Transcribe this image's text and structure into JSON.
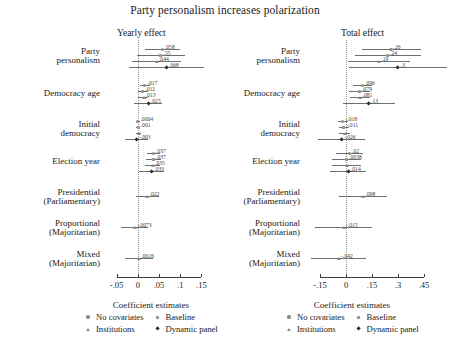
{
  "chart_data": {
    "type": "scatter",
    "title": "Party personalism increases polarization",
    "xlabel": "Coefficient estimates",
    "legend_title": "Coefficient estimates",
    "legend_position": "bottom",
    "grid": false,
    "series_names": [
      "No covariates",
      "Baseline",
      "Institutions",
      "Dynamic panel"
    ],
    "markers": [
      "circle",
      "square",
      "triangle",
      "diamond"
    ],
    "categories": [
      "Party personalism",
      "Democracy age",
      "Initial democracy",
      "Election year",
      "Presidential (Parliamentary)",
      "Proportional (Majoritarian)",
      "Mixed (Majoritarian)"
    ],
    "panels": [
      {
        "name": "Yearly effect",
        "xlim": [
          -0.075,
          0.175
        ],
        "xticks": [
          -0.05,
          0,
          0.05,
          0.1,
          0.15
        ],
        "xticklabels": [
          "-.05",
          "0",
          ".05",
          ".1",
          ".15"
        ],
        "rows": [
          {
            "category": "Party personalism",
            "points": [
              {
                "series": "No covariates",
                "value": 0.058,
                "label": ".058",
                "lo": 0.016,
                "hi": 0.1
              },
              {
                "series": "Baseline",
                "value": 0.055,
                "label": ".55",
                "lo": -0.002,
                "hi": 0.112
              },
              {
                "series": "Institutions",
                "value": 0.044,
                "label": ".044",
                "lo": -0.014,
                "hi": 0.103
              },
              {
                "series": "Dynamic panel",
                "value": 0.068,
                "label": ".068",
                "lo": -0.02,
                "hi": 0.157
              }
            ]
          },
          {
            "category": "Democracy age",
            "points": [
              {
                "series": "No covariates",
                "value": 0.017,
                "label": ".017",
                "lo": 0.006,
                "hi": 0.028
              },
              {
                "series": "Baseline",
                "value": 0.012,
                "label": ".012",
                "lo": 0.0,
                "hi": 0.024
              },
              {
                "series": "Institutions",
                "value": 0.013,
                "label": ".013",
                "lo": 0.001,
                "hi": 0.025
              },
              {
                "series": "Dynamic panel",
                "value": 0.025,
                "label": ".025",
                "lo": -0.008,
                "hi": 0.058
              }
            ]
          },
          {
            "category": "Initial democracy",
            "points": [
              {
                "series": "No covariates",
                "value": 0.0004,
                "label": ".0004",
                "lo": -0.004,
                "hi": 0.005
              },
              {
                "series": "Baseline",
                "value": 0.001,
                "label": ".001",
                "lo": -0.004,
                "hi": 0.006
              },
              {
                "series": "Institutions",
                "value": 0.0015,
                "label": "",
                "lo": -0.004,
                "hi": 0.007
              },
              {
                "series": "Dynamic panel",
                "value": -0.003,
                "label": "-.003",
                "lo": -0.03,
                "hi": 0.024
              }
            ]
          },
          {
            "category": "Election year",
            "points": [
              {
                "series": "No covariates",
                "value": 0.037,
                "label": ".037",
                "lo": 0.021,
                "hi": 0.053
              },
              {
                "series": "Baseline",
                "value": 0.037,
                "label": ".037",
                "lo": 0.02,
                "hi": 0.054
              },
              {
                "series": "Institutions",
                "value": 0.035,
                "label": ".035",
                "lo": 0.018,
                "hi": 0.052
              },
              {
                "series": "Dynamic panel",
                "value": 0.033,
                "label": ".033",
                "lo": 0.004,
                "hi": 0.062
              }
            ]
          },
          {
            "category": "Presidential (Parliamentary)",
            "points": [
              {
                "series": "Institutions",
                "value": 0.022,
                "label": ".022",
                "lo": -0.005,
                "hi": 0.049
              }
            ]
          },
          {
            "category": "Proportional (Majoritarian)",
            "points": [
              {
                "series": "Institutions",
                "value": -0.0073,
                "label": "-.0073",
                "lo": -0.04,
                "hi": 0.025
              }
            ]
          },
          {
            "category": "Mixed (Majoritarian)",
            "points": [
              {
                "series": "Institutions",
                "value": 0.0026,
                "label": ".0026",
                "lo": -0.03,
                "hi": 0.035
              }
            ]
          }
        ]
      },
      {
        "name": "Total effect",
        "xlim": [
          -0.225,
          0.525
        ],
        "xticks": [
          -0.15,
          0,
          0.15,
          0.3,
          0.45
        ],
        "xticklabels": [
          "-.15",
          "0",
          ".15",
          ".3",
          ".45"
        ],
        "rows": [
          {
            "category": "Party personalism",
            "points": [
              {
                "series": "No covariates",
                "value": 0.26,
                "label": ".26",
                "lo": 0.09,
                "hi": 0.43
              },
              {
                "series": "Baseline",
                "value": 0.24,
                "label": ".24",
                "lo": 0.05,
                "hi": 0.43
              },
              {
                "series": "Institutions",
                "value": 0.19,
                "label": ".19",
                "lo": 0.01,
                "hi": 0.37
              },
              {
                "series": "Dynamic panel",
                "value": 0.3,
                "label": ".3",
                "lo": 0.02,
                "hi": 0.58
              }
            ]
          },
          {
            "category": "Democracy age",
            "points": [
              {
                "series": "No covariates",
                "value": 0.096,
                "label": ".096",
                "lo": 0.04,
                "hi": 0.152
              },
              {
                "series": "Baseline",
                "value": 0.079,
                "label": ".079",
                "lo": 0.02,
                "hi": 0.138
              },
              {
                "series": "Institutions",
                "value": 0.081,
                "label": ".081",
                "lo": 0.022,
                "hi": 0.14
              },
              {
                "series": "Dynamic panel",
                "value": 0.13,
                "label": ".13",
                "lo": -0.02,
                "hi": 0.28
              }
            ]
          },
          {
            "category": "Initial democracy",
            "points": [
              {
                "series": "No covariates",
                "value": -0.018,
                "label": "-.018",
                "lo": -0.048,
                "hi": 0.012
              },
              {
                "series": "Baseline",
                "value": -0.011,
                "label": "-.011",
                "lo": -0.042,
                "hi": 0.02
              },
              {
                "series": "Institutions",
                "value": -0.008,
                "label": "",
                "lo": -0.04,
                "hi": 0.024
              },
              {
                "series": "Dynamic panel",
                "value": -0.026,
                "label": "-.026",
                "lo": -0.16,
                "hi": 0.108
              }
            ]
          },
          {
            "category": "Election year",
            "points": [
              {
                "series": "No covariates",
                "value": 0.02,
                "label": ".02",
                "lo": -0.06,
                "hi": 0.1
              },
              {
                "series": "Baseline",
                "value": 0.0038,
                "label": ".0038",
                "lo": -0.08,
                "hi": 0.088
              },
              {
                "series": "Institutions",
                "value": 0.002,
                "label": "",
                "lo": -0.082,
                "hi": 0.086
              },
              {
                "series": "Dynamic panel",
                "value": 0.014,
                "label": ".014",
                "lo": -0.09,
                "hi": 0.118
              }
            ]
          },
          {
            "category": "Presidential (Parliamentary)",
            "points": [
              {
                "series": "Institutions",
                "value": 0.098,
                "label": ".098",
                "lo": -0.04,
                "hi": 0.236
              }
            ]
          },
          {
            "category": "Proportional (Majoritarian)",
            "points": [
              {
                "series": "Institutions",
                "value": -0.015,
                "label": "-.015",
                "lo": -0.18,
                "hi": 0.15
              }
            ]
          },
          {
            "category": "Mixed (Majoritarian)",
            "points": [
              {
                "series": "Institutions",
                "value": -0.042,
                "label": "-.042",
                "lo": -0.2,
                "hi": 0.116
              }
            ]
          }
        ]
      }
    ]
  },
  "legend": {
    "title": "Coefficient estimates",
    "entries": [
      {
        "label": "No covariates",
        "marker": "circle"
      },
      {
        "label": "Baseline",
        "marker": "square"
      },
      {
        "label": "Institutions",
        "marker": "triangle"
      },
      {
        "label": "Dynamic panel",
        "marker": "diamond"
      }
    ]
  }
}
